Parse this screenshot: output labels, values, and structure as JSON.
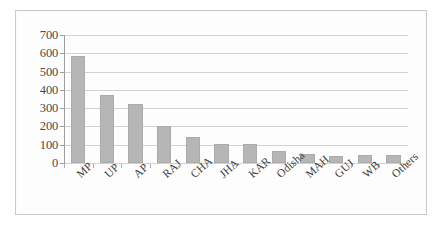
{
  "chart_data": {
    "type": "bar",
    "title": "",
    "xlabel": "",
    "ylabel": "",
    "ylim": [
      0,
      700
    ],
    "ytick_step": 100,
    "yticks": [
      700,
      600,
      500,
      400,
      300,
      200,
      100,
      0
    ],
    "grid": true,
    "legend": false,
    "bar_color": "#b6b6b6",
    "bar_border_color": "#ababab",
    "gridline_color": "#d2d2d2",
    "axis_color": "#9d9d9d",
    "frame_color": "#c9c9c9",
    "background_color": "#fdfdfd",
    "label_rotation_deg": -42,
    "categories": [
      "MP",
      "UP",
      "AP",
      "RAJ",
      "CHA",
      "JHA",
      "KAR",
      "Odisha",
      "MAH",
      "GUJ",
      "WB",
      "Others"
    ],
    "values": [
      585,
      370,
      325,
      205,
      140,
      105,
      105,
      65,
      50,
      40,
      42,
      45
    ]
  }
}
